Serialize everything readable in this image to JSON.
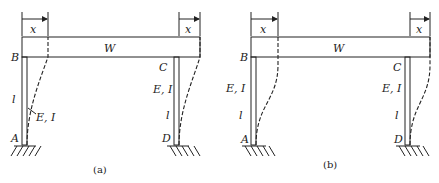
{
  "figures": [
    {
      "id": "a",
      "caption": "(a)",
      "beam_label": "W",
      "displacement_left": "x",
      "displacement_right": "x",
      "nodes": {
        "top_left": "B",
        "top_right": "C",
        "bottom_left": "A",
        "bottom_right": "D"
      },
      "left_column": {
        "length": "l",
        "stiffness": "E, I"
      },
      "right_column": {
        "stiffness": "E, I",
        "length": "l"
      },
      "deflection": "cantilever (fixed base, free top rotation)"
    },
    {
      "id": "b",
      "caption": "(b)",
      "beam_label": "W",
      "displacement_left": "x",
      "displacement_right": "x",
      "nodes": {
        "top_left": "B",
        "top_right": "C",
        "bottom_left": "A",
        "bottom_right": "D"
      },
      "left_column": {
        "stiffness": "E, I",
        "length": "l"
      },
      "right_column": {
        "stiffness": "E, I",
        "length": "l"
      },
      "deflection": "double curvature (fixed base, fixed top)"
    }
  ]
}
